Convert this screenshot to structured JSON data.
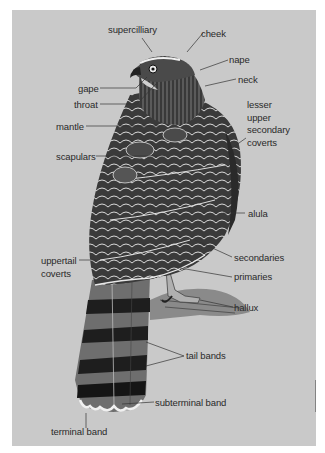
{
  "figure": {
    "background_color": "#c9c9c9",
    "labels": [
      {
        "id": "supercilliary",
        "text": "supercilliary"
      },
      {
        "id": "cheek",
        "text": "cheek"
      },
      {
        "id": "nape",
        "text": "nape"
      },
      {
        "id": "neck",
        "text": "neck"
      },
      {
        "id": "gape",
        "text": "gape"
      },
      {
        "id": "throat",
        "text": "throat"
      },
      {
        "id": "mantle",
        "text": "mantle"
      },
      {
        "id": "lesser_upper_secondary_coverts",
        "lines": [
          "lesser",
          "upper",
          "secondary",
          "coverts"
        ]
      },
      {
        "id": "scapulars",
        "text": "scapulars"
      },
      {
        "id": "alula",
        "text": "alula"
      },
      {
        "id": "uppertail_coverts",
        "lines": [
          "uppertail",
          "coverts"
        ]
      },
      {
        "id": "secondaries",
        "text": "secondaries"
      },
      {
        "id": "primaries",
        "text": "primaries"
      },
      {
        "id": "hallux",
        "text": "hallux"
      },
      {
        "id": "tail_bands",
        "text": "tail bands"
      },
      {
        "id": "subterminal_band",
        "text": "subterminal band"
      },
      {
        "id": "terminal_band",
        "text": "terminal band"
      }
    ]
  }
}
